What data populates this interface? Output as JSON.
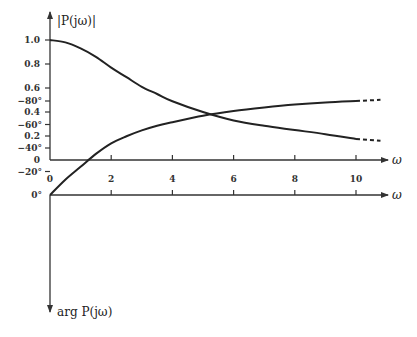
{
  "chart_data": [
    {
      "type": "line",
      "title": "",
      "ylabel": "|P(jω)|",
      "xlabel": "ω",
      "x_ticks": [
        0,
        2,
        4,
        6,
        8,
        10
      ],
      "x_tick_labels": [
        "0",
        "2",
        "4",
        "6",
        "8",
        "10"
      ],
      "y_ticks": [
        0,
        0.2,
        0.4,
        0.6,
        0.8,
        1.0
      ],
      "y_tick_labels": [
        "0",
        "0.2",
        "0.4",
        "0.6",
        "0.8",
        "1.0"
      ],
      "xlim": [
        0,
        11
      ],
      "ylim": [
        0,
        1.0
      ],
      "grid": false,
      "series": [
        {
          "name": "magnitude",
          "x": [
            0,
            0.5,
            1,
            1.5,
            2,
            2.5,
            3,
            3.5,
            4,
            5,
            6,
            7,
            8,
            9,
            10
          ],
          "values": [
            1.0,
            0.98,
            0.93,
            0.86,
            0.77,
            0.69,
            0.61,
            0.55,
            0.49,
            0.4,
            0.33,
            0.285,
            0.25,
            0.215,
            0.175
          ],
          "dashed_extension": {
            "x": [
              10,
              10.8
            ],
            "values": [
              0.175,
              0.16
            ]
          }
        }
      ]
    },
    {
      "type": "line",
      "title": "",
      "ylabel": "arg P(jω)",
      "xlabel": "ω",
      "x_ticks": [
        2,
        4,
        6,
        8,
        10
      ],
      "y_ticks": [
        0,
        -20,
        -40,
        -60,
        -80
      ],
      "y_tick_labels": [
        "0°",
        "−20°",
        "−40°",
        "−60°",
        "−80°"
      ],
      "xlim": [
        0,
        11
      ],
      "ylim": [
        -95,
        0
      ],
      "grid": false,
      "series": [
        {
          "name": "phase",
          "x": [
            0,
            0.5,
            1,
            1.5,
            2,
            2.5,
            3,
            3.5,
            4,
            5,
            6,
            7,
            8,
            9,
            10
          ],
          "values": [
            0,
            -13,
            -24,
            -35,
            -44,
            -50,
            -55,
            -59,
            -62,
            -67.5,
            -71.5,
            -74.5,
            -77,
            -78.8,
            -80
          ],
          "dashed_extension": {
            "x": [
              10,
              10.8
            ],
            "values": [
              -80,
              -81
            ]
          }
        }
      ]
    }
  ],
  "labels": {
    "top_ylabel": "|P(jω)|",
    "bottom_ylabel": "arg P(jω)",
    "omega": "ω"
  },
  "colors": {
    "line": "#222222",
    "axis": "#333333"
  }
}
